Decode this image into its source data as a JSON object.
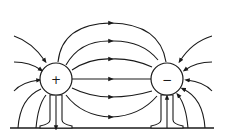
{
  "diagram": {
    "charges": [
      {
        "id": "positive",
        "sign": "+",
        "cx": 56,
        "cy": 79,
        "r": 16
      },
      {
        "id": "negative",
        "sign": "−",
        "cx": 167,
        "cy": 79,
        "r": 16
      }
    ],
    "colors": {
      "ink": "#1a1a1a",
      "background": "#ffffff"
    }
  }
}
